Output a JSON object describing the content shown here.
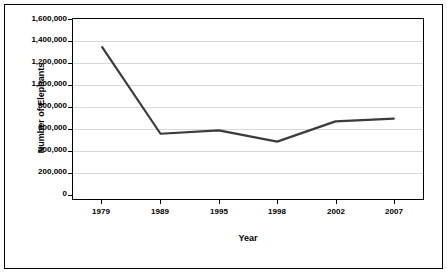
{
  "chart_data": {
    "type": "line",
    "title": "",
    "xlabel": "Year",
    "ylabel": "Number of Elephants",
    "categories": [
      "1979",
      "1989",
      "1995",
      "1998",
      "2002",
      "2007"
    ],
    "values": [
      1350000,
      580000,
      610000,
      510000,
      690000,
      715000
    ],
    "series": [
      {
        "name": "Number of Elephants",
        "values": [
          1350000,
          580000,
          610000,
          510000,
          690000,
          715000
        ],
        "color": "#3b3b3b"
      }
    ],
    "ylim": [
      0,
      1600000
    ],
    "ytick_labels": [
      "1,600,000",
      "1,400,000",
      "1,200,000",
      "1,000,000",
      "800,000",
      "600,000",
      "400,000",
      "200,000",
      "0"
    ],
    "ytick_values": [
      1600000,
      1400000,
      1200000,
      1000000,
      800000,
      600000,
      400000,
      200000,
      0
    ],
    "xtick_labels": [
      "1979",
      "1989",
      "1995",
      "1998",
      "2002",
      "2007"
    ],
    "grid": "horizontal",
    "legend": "none",
    "line_color": "#3b3b3b",
    "gridline_color": "#d9d9d9",
    "axis_color": "#000000",
    "background_color": "#ffffff"
  }
}
